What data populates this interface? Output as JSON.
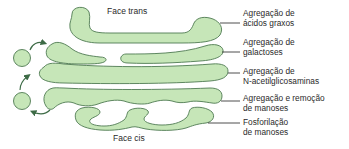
{
  "diagram": {
    "colors": {
      "cisterna_fill": "#c6e6b8",
      "cisterna_stroke": "#4f7a52",
      "arrow": "#3d6b46",
      "leader_line": "#222222",
      "text": "#2a2a2a"
    },
    "faces": {
      "trans": "Face trans",
      "cis": "Face cis"
    },
    "labels": [
      {
        "line1": "Agregação de",
        "line2": "ácidos graxos"
      },
      {
        "line1": "Agregação de",
        "line2": "galactoses"
      },
      {
        "line1": "Agregação de",
        "line2": "N-acetilglicosaminas"
      },
      {
        "line1": "Agregação e remoção",
        "line2": "de manoses"
      },
      {
        "line1": "Fosforilação",
        "line2": "de manoses"
      }
    ]
  }
}
